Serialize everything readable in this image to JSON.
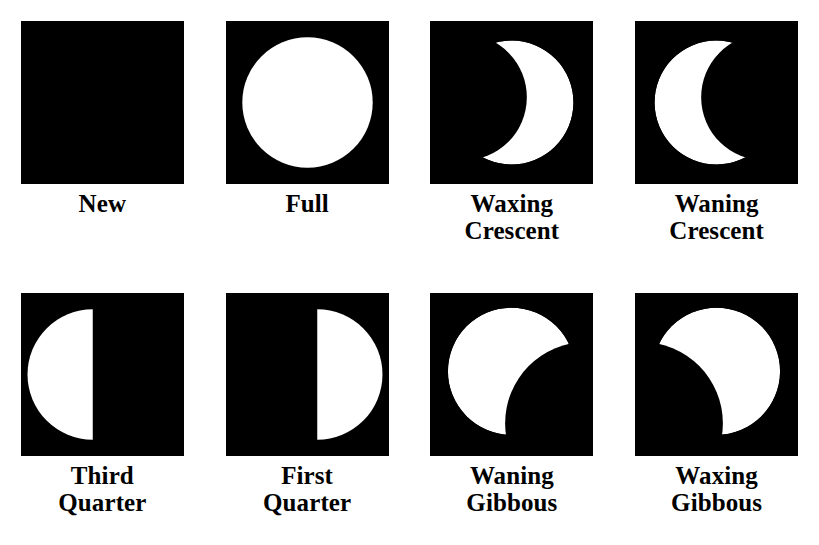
{
  "figure": {
    "background_color": "#ffffff",
    "panel_color": "#000000",
    "lit_color": "#ffffff",
    "label_color": "#000000",
    "columns": 4,
    "rows": 2
  },
  "phases": [
    {
      "id": "new",
      "label": "New",
      "illumination_percent": 0,
      "lit_side": "none",
      "shape": "none"
    },
    {
      "id": "full",
      "label": "Full",
      "illumination_percent": 100,
      "lit_side": "all",
      "shape": "circle"
    },
    {
      "id": "waxing-crescent",
      "label": "Waxing\nCrescent",
      "illumination_percent": 18,
      "lit_side": "right",
      "shape": "crescent-right"
    },
    {
      "id": "waning-crescent",
      "label": "Waning\nCrescent",
      "illumination_percent": 18,
      "lit_side": "left",
      "shape": "crescent-left"
    },
    {
      "id": "third-quarter",
      "label": "Third\nQuarter",
      "illumination_percent": 50,
      "lit_side": "left",
      "shape": "half-left"
    },
    {
      "id": "first-quarter",
      "label": "First\nQuarter",
      "illumination_percent": 50,
      "lit_side": "right",
      "shape": "half-right"
    },
    {
      "id": "waning-gibbous",
      "label": "Waning\nGibbous",
      "illumination_percent": 80,
      "lit_side": "left",
      "shape": "gibbous-left"
    },
    {
      "id": "waxing-gibbous",
      "label": "Waxing\nGibbous",
      "illumination_percent": 80,
      "lit_side": "right",
      "shape": "gibbous-right"
    }
  ]
}
